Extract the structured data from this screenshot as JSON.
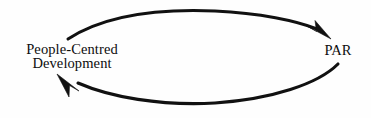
{
  "diagram": {
    "type": "cycle",
    "title": "",
    "background_color": "#fefefe",
    "stroke_color": "#111111",
    "text_color": "#0d0d0d",
    "nodes": [
      {
        "id": "people-centred-development",
        "label_line1": "People-Centred",
        "label_line2": "Development",
        "position": "left"
      },
      {
        "id": "par",
        "label_line1": "PAR",
        "label_line2": "",
        "position": "right"
      }
    ],
    "arrows": [
      {
        "id": "top-arrow",
        "from": "people-centred-development",
        "to": "par",
        "direction": "left-to-right",
        "curve": "arc-above"
      },
      {
        "id": "bottom-arrow",
        "from": "par",
        "to": "people-centred-development",
        "direction": "right-to-left",
        "curve": "arc-below"
      }
    ]
  }
}
